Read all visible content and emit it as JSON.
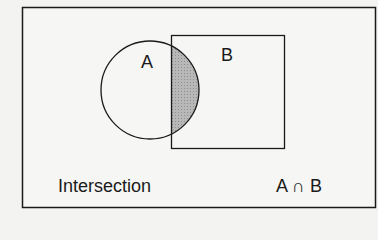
{
  "diagram": {
    "type": "venn",
    "set_a_label": "A",
    "set_b_label": "B",
    "caption": "Intersection",
    "notation": "A ∩ B",
    "colors": {
      "stroke": "#1a1a1a",
      "shade": "#b0b0b0",
      "background": "#f3f3f1"
    }
  }
}
